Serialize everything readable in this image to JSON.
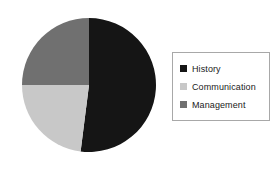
{
  "chart_data": {
    "type": "pie",
    "title": "",
    "labels": [
      "History",
      "Communication",
      "Management"
    ],
    "values": [
      52,
      23,
      25
    ],
    "unit": "percent",
    "colors": [
      "#151515",
      "#c8c8c8",
      "#707070"
    ],
    "start_angle_deg": 0,
    "direction": "clockwise",
    "legend_position": "right",
    "legend_border_color": "#a8a8a8",
    "background": "#ffffff",
    "slices": [
      {
        "label": "History",
        "value": 52,
        "color": "#151515",
        "start_deg": 0,
        "end_deg": 187
      },
      {
        "label": "Communication",
        "value": 23,
        "color": "#c8c8c8",
        "start_deg": 187,
        "end_deg": 270
      },
      {
        "label": "Management",
        "value": 25,
        "color": "#707070",
        "start_deg": 270,
        "end_deg": 360
      }
    ]
  },
  "legend": {
    "items": [
      {
        "label": "History",
        "swatch_color": "#151515"
      },
      {
        "label": "Communication",
        "swatch_color": "#c8c8c8"
      },
      {
        "label": "Management",
        "swatch_color": "#707070"
      }
    ]
  }
}
